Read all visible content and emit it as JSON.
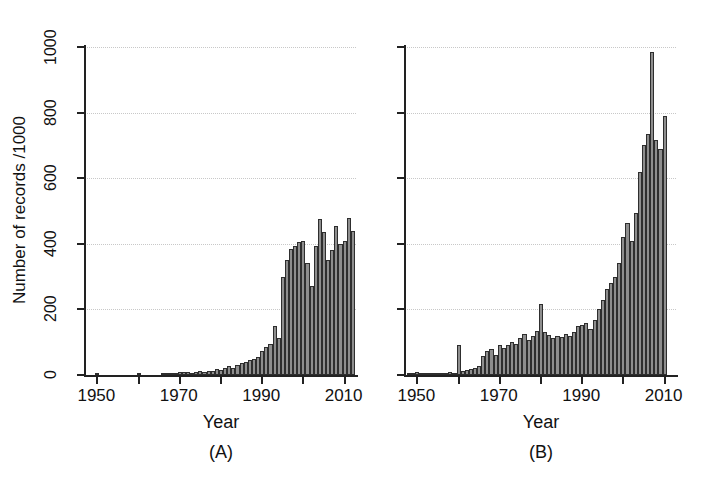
{
  "figure": {
    "ylabel": "Number of records /1000",
    "yticks": [
      0,
      200,
      400,
      600,
      800,
      1000
    ],
    "xticks": [
      1950,
      1970,
      1990,
      2010
    ],
    "xticks_minor": [
      1960,
      1980,
      2000
    ],
    "xlabel": "Year",
    "panel_a_label": "(A)",
    "panel_b_label": "(B)",
    "axis_color": "#222222",
    "bar_fill": "#8e8e8e",
    "bar_edge": "#2e2e2e",
    "grid_color": "#c8c8c8",
    "background": "#ffffff"
  },
  "chart_data": [
    {
      "type": "bar",
      "panel": "(A)",
      "title": "",
      "xlabel": "Year",
      "ylabel": "Number of records /1000",
      "xlim": [
        1947,
        2013
      ],
      "ylim": [
        0,
        1000
      ],
      "grid": true,
      "legend": "none",
      "x": [
        1950,
        1960,
        1966,
        1967,
        1968,
        1969,
        1970,
        1971,
        1972,
        1973,
        1974,
        1975,
        1976,
        1977,
        1978,
        1979,
        1980,
        1981,
        1982,
        1983,
        1984,
        1985,
        1986,
        1987,
        1988,
        1989,
        1990,
        1991,
        1992,
        1993,
        1994,
        1995,
        1996,
        1997,
        1998,
        1999,
        2000,
        2001,
        2002,
        2003,
        2004,
        2005,
        2006,
        2007,
        2008,
        2009,
        2010,
        2011,
        2012
      ],
      "values": [
        6,
        6,
        3,
        4,
        5,
        6,
        8,
        9,
        8,
        7,
        9,
        11,
        10,
        12,
        13,
        18,
        14,
        22,
        26,
        20,
        32,
        36,
        41,
        45,
        48,
        56,
        72,
        86,
        95,
        150,
        113,
        300,
        350,
        385,
        393,
        405,
        408,
        340,
        270,
        392,
        475,
        435,
        350,
        380,
        455,
        400,
        410,
        478,
        440,
        335
      ]
    },
    {
      "type": "bar",
      "panel": "(B)",
      "title": "",
      "xlabel": "Year",
      "ylabel": "Number of records /1000",
      "xlim": [
        1947,
        2013
      ],
      "ylim": [
        0,
        1000
      ],
      "grid": true,
      "legend": "none",
      "x": [
        1948,
        1949,
        1950,
        1951,
        1952,
        1953,
        1954,
        1955,
        1956,
        1957,
        1958,
        1959,
        1960,
        1961,
        1962,
        1963,
        1964,
        1965,
        1966,
        1967,
        1968,
        1969,
        1970,
        1971,
        1972,
        1973,
        1974,
        1975,
        1976,
        1977,
        1978,
        1979,
        1980,
        1981,
        1982,
        1983,
        1984,
        1985,
        1986,
        1987,
        1988,
        1989,
        1990,
        1991,
        1992,
        1993,
        1994,
        1995,
        1996,
        1997,
        1998,
        1999,
        2000,
        2001,
        2002,
        2003,
        2004,
        2005,
        2006,
        2007,
        2008,
        2009,
        2010
      ],
      "values": [
        3,
        5,
        8,
        7,
        6,
        7,
        6,
        7,
        6,
        7,
        8,
        6,
        92,
        12,
        14,
        18,
        22,
        26,
        58,
        72,
        80,
        62,
        92,
        82,
        90,
        100,
        96,
        112,
        126,
        108,
        120,
        134,
        215,
        130,
        122,
        112,
        118,
        116,
        126,
        120,
        132,
        148,
        152,
        160,
        140,
        168,
        200,
        230,
        262,
        280,
        300,
        340,
        420,
        462,
        410,
        495,
        620,
        700,
        735,
        985,
        718,
        688,
        790
      ]
    }
  ]
}
